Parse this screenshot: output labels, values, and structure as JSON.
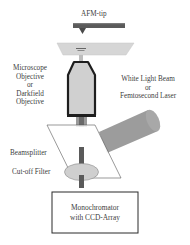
{
  "diagram": {
    "labels": {
      "afm_tip": "AFM-tip",
      "objective": [
        "Microscope",
        "Objective",
        "or",
        "Darkfield",
        "Objective"
      ],
      "light_source": [
        "White Light Beam",
        "or",
        "Femtosecond Laser"
      ],
      "beamsplitter": "Beamsplitter",
      "cutoff_filter": "Cut-off Filter",
      "detector": [
        "Monochromator",
        "with CCD-Array"
      ]
    },
    "colors": {
      "cantilever": "#5a5a5a",
      "sample_plate": "#d4d4d4",
      "objective_body": "#d2d2d2",
      "objective_outline": "#1e1e1e",
      "beam": "#6e6e6e",
      "light_beam": "#9a9a9a",
      "filter": "#cfcfcf",
      "box_outline": "#2a2a2a"
    }
  }
}
